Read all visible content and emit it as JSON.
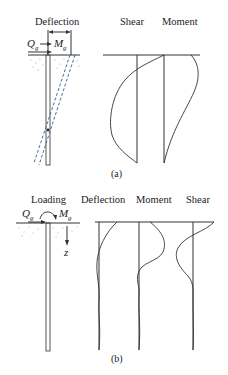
{
  "panel_a": {
    "caption": "(a)",
    "labels": {
      "deflection": "Deflection",
      "shear": "Shear",
      "moment": "Moment"
    },
    "loads": {
      "horizontal_force": "Q",
      "horizontal_force_sub": "g",
      "moment": "M",
      "moment_sub": "g"
    },
    "description": "Short rigid pile rotating about a point near its base; shear and moment distributions along depth"
  },
  "panel_b": {
    "caption": "(b)",
    "labels": {
      "loading": "Loading",
      "deflection": "Deflection",
      "moment": "Moment",
      "shear": "Shear"
    },
    "loads": {
      "horizontal_force": "Q",
      "horizontal_force_sub": "g",
      "moment": "M",
      "moment_sub": "g",
      "depth_axis": "z"
    },
    "description": "Long flexible pile; deflection, moment and shear profiles decay with depth"
  },
  "colors": {
    "line": "#333333",
    "pile_deflected": "#3a5a9a",
    "soil": "#7a9a9a"
  }
}
